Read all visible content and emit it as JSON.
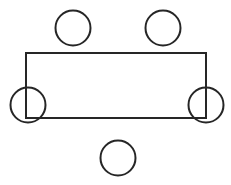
{
  "canvas": {
    "width": 231,
    "height": 185,
    "background_color": "#ffffff",
    "title": "Rectangular table seating diagram"
  },
  "style": {
    "stroke_color": "#262626",
    "stroke_width": 2,
    "fill": "none"
  },
  "chart_data": {
    "type": "diagram",
    "xlabel": "",
    "ylabel": "",
    "xlim": [
      0,
      231
    ],
    "ylim": [
      0,
      185
    ],
    "grid": false,
    "legend": false,
    "shapes": [
      {
        "id": "table",
        "name": "table-rectangle",
        "type": "rect",
        "x": 26,
        "y": 53,
        "width": 180,
        "height": 65,
        "stroke": "#262626",
        "stroke_width": 2,
        "fill": "none"
      },
      {
        "id": "seat-top-left",
        "name": "seat-top-left",
        "type": "circle",
        "cx": 73,
        "cy": 28,
        "r": 17.5,
        "stroke": "#262626",
        "stroke_width": 2,
        "fill": "none"
      },
      {
        "id": "seat-top-right",
        "name": "seat-top-right",
        "type": "circle",
        "cx": 163,
        "cy": 28,
        "r": 17.5,
        "stroke": "#262626",
        "stroke_width": 2,
        "fill": "none"
      },
      {
        "id": "seat-corner-bottom-left",
        "name": "seat-corner-bottom-left",
        "type": "circle",
        "cx": 28,
        "cy": 105,
        "r": 17.5,
        "stroke": "#262626",
        "stroke_width": 2,
        "fill": "none"
      },
      {
        "id": "seat-corner-bottom-right",
        "name": "seat-corner-bottom-right",
        "type": "circle",
        "cx": 206,
        "cy": 105,
        "r": 17.5,
        "stroke": "#262626",
        "stroke_width": 2,
        "fill": "none"
      },
      {
        "id": "seat-bottom-center",
        "name": "seat-bottom-center",
        "type": "circle",
        "cx": 118,
        "cy": 158,
        "r": 17.5,
        "stroke": "#262626",
        "stroke_width": 2,
        "fill": "none"
      }
    ],
    "counts": {
      "seats": 5,
      "tables": 1
    }
  }
}
